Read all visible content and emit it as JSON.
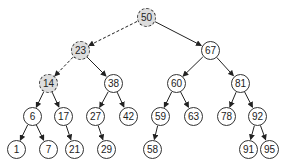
{
  "nodes": [
    {
      "id": "50",
      "label": "50",
      "x": 146,
      "y": 17,
      "highlight": true
    },
    {
      "id": "23",
      "label": "23",
      "x": 80,
      "y": 50,
      "highlight": true
    },
    {
      "id": "67",
      "label": "67",
      "x": 210,
      "y": 50,
      "highlight": false
    },
    {
      "id": "14",
      "label": "14",
      "x": 48,
      "y": 83,
      "highlight": true
    },
    {
      "id": "38",
      "label": "38",
      "x": 113,
      "y": 83,
      "highlight": false
    },
    {
      "id": "60",
      "label": "60",
      "x": 176,
      "y": 83,
      "highlight": false
    },
    {
      "id": "81",
      "label": "81",
      "x": 240,
      "y": 83,
      "highlight": false
    },
    {
      "id": "6",
      "label": "6",
      "x": 32,
      "y": 116,
      "highlight": false
    },
    {
      "id": "17",
      "label": "17",
      "x": 63,
      "y": 116,
      "highlight": false
    },
    {
      "id": "27",
      "label": "27",
      "x": 95,
      "y": 116,
      "highlight": false
    },
    {
      "id": "42",
      "label": "42",
      "x": 128,
      "y": 116,
      "highlight": false
    },
    {
      "id": "59",
      "label": "59",
      "x": 160,
      "y": 116,
      "highlight": false
    },
    {
      "id": "63",
      "label": "63",
      "x": 193,
      "y": 116,
      "highlight": false
    },
    {
      "id": "78",
      "label": "78",
      "x": 226,
      "y": 116,
      "highlight": false
    },
    {
      "id": "92",
      "label": "92",
      "x": 257,
      "y": 116,
      "highlight": false
    },
    {
      "id": "1",
      "label": "1",
      "x": 16,
      "y": 149,
      "highlight": false
    },
    {
      "id": "7",
      "label": "7",
      "x": 48,
      "y": 149,
      "highlight": false
    },
    {
      "id": "21",
      "label": "21",
      "x": 74,
      "y": 149,
      "highlight": false
    },
    {
      "id": "29",
      "label": "29",
      "x": 106,
      "y": 149,
      "highlight": false
    },
    {
      "id": "58",
      "label": "58",
      "x": 152,
      "y": 149,
      "highlight": false
    },
    {
      "id": "91",
      "label": "91",
      "x": 248,
      "y": 149,
      "highlight": false
    },
    {
      "id": "95",
      "label": "95",
      "x": 269,
      "y": 149,
      "highlight": false
    }
  ],
  "edges": [
    {
      "from": "50",
      "to": "23",
      "dashed": true
    },
    {
      "from": "50",
      "to": "67",
      "dashed": false
    },
    {
      "from": "23",
      "to": "14",
      "dashed": true
    },
    {
      "from": "23",
      "to": "38",
      "dashed": false
    },
    {
      "from": "67",
      "to": "60",
      "dashed": false
    },
    {
      "from": "67",
      "to": "81",
      "dashed": false
    },
    {
      "from": "14",
      "to": "6",
      "dashed": false
    },
    {
      "from": "14",
      "to": "17",
      "dashed": false
    },
    {
      "from": "38",
      "to": "27",
      "dashed": false
    },
    {
      "from": "38",
      "to": "42",
      "dashed": false
    },
    {
      "from": "60",
      "to": "59",
      "dashed": false
    },
    {
      "from": "60",
      "to": "63",
      "dashed": false
    },
    {
      "from": "81",
      "to": "78",
      "dashed": false
    },
    {
      "from": "81",
      "to": "92",
      "dashed": false
    },
    {
      "from": "6",
      "to": "1",
      "dashed": false
    },
    {
      "from": "6",
      "to": "7",
      "dashed": false
    },
    {
      "from": "17",
      "to": "21",
      "dashed": false
    },
    {
      "from": "27",
      "to": "29",
      "dashed": false
    },
    {
      "from": "59",
      "to": "58",
      "dashed": false
    },
    {
      "from": "92",
      "to": "91",
      "dashed": false
    },
    {
      "from": "92",
      "to": "95",
      "dashed": false
    }
  ]
}
